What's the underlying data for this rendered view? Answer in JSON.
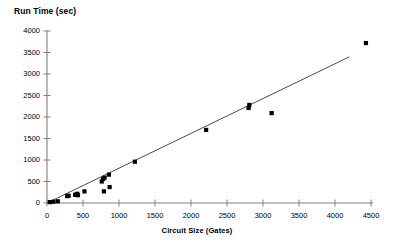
{
  "chart_data": {
    "type": "scatter",
    "title": "",
    "ylabel": "Run Time (sec)",
    "xlabel": "Circuit Size (Gates)",
    "xlim": [
      0,
      4500
    ],
    "ylim": [
      0,
      4000
    ],
    "grid": false,
    "legend": null,
    "xticks": [
      0,
      500,
      1000,
      1500,
      2000,
      2500,
      3000,
      3500,
      4000,
      4500
    ],
    "yticks": [
      0,
      500,
      1000,
      1500,
      2000,
      2500,
      3000,
      3500,
      4000
    ],
    "marker_color": "#000000",
    "marker_shape": "square",
    "axis_color": "#808080",
    "trendline": {
      "x": [
        0,
        4200
      ],
      "y": [
        0,
        3400
      ],
      "color": "#4d4d4d"
    },
    "series": [
      {
        "name": "Run Time vs Circuit Size",
        "points": [
          [
            40,
            20
          ],
          [
            90,
            30
          ],
          [
            150,
            40
          ],
          [
            280,
            160
          ],
          [
            300,
            170
          ],
          [
            390,
            190
          ],
          [
            410,
            200
          ],
          [
            420,
            215
          ],
          [
            430,
            180
          ],
          [
            520,
            270
          ],
          [
            760,
            500
          ],
          [
            780,
            560
          ],
          [
            790,
            270
          ],
          [
            800,
            590
          ],
          [
            860,
            660
          ],
          [
            870,
            370
          ],
          [
            1220,
            960
          ],
          [
            2210,
            1700
          ],
          [
            2800,
            2210
          ],
          [
            2810,
            2280
          ],
          [
            3120,
            2090
          ],
          [
            4430,
            3720
          ]
        ]
      }
    ]
  },
  "axis": {
    "y_tick_labels": [
      "4000",
      "3500",
      "3000",
      "2500",
      "2000",
      "1500",
      "1000",
      "500",
      "0"
    ],
    "x_tick_labels": [
      "0",
      "500",
      "1000",
      "1500",
      "2000",
      "2500",
      "3000",
      "3500",
      "4000",
      "4500"
    ]
  }
}
